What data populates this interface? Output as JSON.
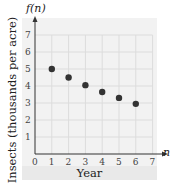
{
  "chart_data": {
    "type": "scatter",
    "title": "",
    "xlabel": "Year",
    "ylabel": "Insects (thousands per acre)",
    "x_axis_variable": "n",
    "y_axis_variable": "f(n)",
    "x": [
      1,
      2,
      3,
      4,
      5,
      6
    ],
    "series": [
      {
        "name": "f(n)",
        "values": [
          5.0,
          4.5,
          4.05,
          3.65,
          3.3,
          2.95
        ]
      }
    ],
    "xlim": [
      0,
      7
    ],
    "ylim": [
      0,
      7
    ],
    "xticks": [
      "0",
      "1",
      "2",
      "3",
      "4",
      "5",
      "6",
      "7"
    ],
    "yticks": [
      "1",
      "2",
      "3",
      "4",
      "5",
      "6",
      "7"
    ],
    "grid": true,
    "legend": null
  },
  "labels": {
    "y_axis_name": "f(n)",
    "x_axis_name": "n",
    "y_title": "Insects (thousands per acre)",
    "x_title": "Year"
  },
  "colors": {
    "point": "#333333",
    "grid": "#dcdcdc",
    "axis": "#333333",
    "plot_background": "#f2f2f2"
  }
}
